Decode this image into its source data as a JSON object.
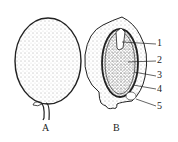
{
  "figure": {
    "panels": [
      {
        "id": "A",
        "label": "A",
        "description": "whole fruit with stalk"
      },
      {
        "id": "B",
        "label": "B",
        "description": "longitudinal section of fruit"
      }
    ],
    "callouts": [
      {
        "number": "1"
      },
      {
        "number": "2"
      },
      {
        "number": "3"
      },
      {
        "number": "4"
      },
      {
        "number": "5"
      }
    ],
    "colors": {
      "ink": "#222222",
      "stipple": "#555555",
      "background": "#ffffff"
    }
  }
}
